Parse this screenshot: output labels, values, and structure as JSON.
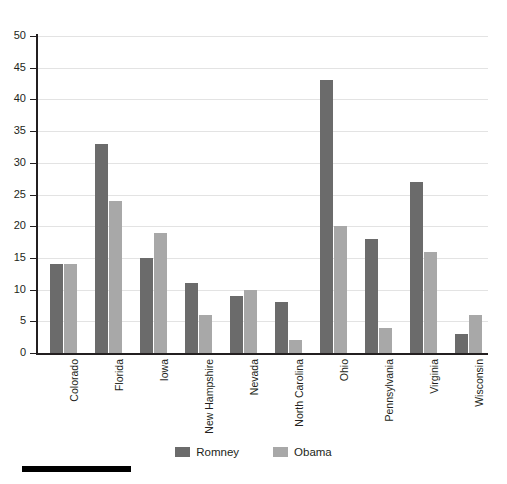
{
  "chart_data": {
    "type": "bar",
    "title": "",
    "subtitle": "",
    "xlabel": "",
    "ylabel": "",
    "ylim": [
      0,
      50
    ],
    "ytick_step": 5,
    "yticks": [
      0,
      5,
      10,
      15,
      20,
      25,
      30,
      35,
      40,
      45,
      50
    ],
    "grid": true,
    "grid_axis": "y",
    "legend_position": "bottom-center",
    "orientation": "vertical",
    "grouping": "grouped",
    "categories": [
      "Colorado",
      "Florida",
      "Iowa",
      "New Hampshire",
      "Nevada",
      "North Carolina",
      "Ohio",
      "Pennsylvania",
      "Virginia",
      "Wisconsin"
    ],
    "series": [
      {
        "name": "Romney",
        "color": "#6b6b6b",
        "values": [
          14,
          33,
          15,
          11,
          9,
          8,
          43,
          18,
          27,
          3
        ]
      },
      {
        "name": "Obama",
        "color": "#a8a8a8",
        "values": [
          14,
          24,
          19,
          6,
          10,
          2,
          20,
          4,
          16,
          6
        ]
      }
    ],
    "annotations": []
  },
  "legend": {
    "items": [
      {
        "label": "Romney",
        "color": "#6b6b6b"
      },
      {
        "label": "Obama",
        "color": "#a8a8a8"
      }
    ]
  },
  "axes": {
    "axis_color": "#231f20",
    "gridline_color": "#e3e3e3"
  },
  "decoration": {
    "bottom_rule_color": "#000000"
  }
}
